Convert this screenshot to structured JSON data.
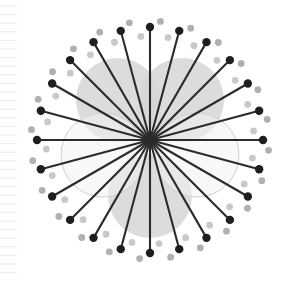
{
  "figure": {
    "width": 299,
    "height": 282,
    "background_color": "#ffffff"
  },
  "chart_data": {
    "type": "scatter",
    "subtitle": "",
    "xlabel": "",
    "ylabel": "",
    "grid": false,
    "legend_position": "none",
    "xlim": [
      0,
      299
    ],
    "ylim": [
      0,
      282
    ],
    "center": {
      "x": 150,
      "y": 140
    },
    "spokes": {
      "count": 24,
      "angle_step_deg": 15,
      "start_angle_deg": 90,
      "inner_radius": 0,
      "outer_radius": 113,
      "line_color": "#2b2b2b",
      "line_width": 2.1,
      "endpoint_marker": {
        "shape": "circle",
        "radius": 4.2,
        "color": "#1f1f1f"
      },
      "angles_deg": [
        0,
        15,
        30,
        45,
        60,
        75,
        90,
        105,
        120,
        135,
        150,
        165,
        180,
        195,
        210,
        225,
        240,
        255,
        270,
        285,
        300,
        315,
        330,
        345
      ],
      "lengths": [
        113,
        113,
        113,
        113,
        113,
        113,
        113,
        113,
        113,
        113,
        113,
        113,
        113,
        113,
        113,
        113,
        113,
        113,
        113,
        113,
        113,
        113,
        113,
        113
      ]
    },
    "light_dots": {
      "count": 48,
      "note": "two interleaved rings of pale markers between the spoke endpoints",
      "rings": [
        {
          "name": "inner-pale-ring",
          "radius": 104,
          "angle_offset_deg": 5,
          "angle_step_deg": 15,
          "color": "#c9c9c9",
          "marker_radius": 3.4
        },
        {
          "name": "outer-pale-ring",
          "radius": 119,
          "angle_offset_deg": 10,
          "angle_step_deg": 15,
          "color": "#b0b0b0",
          "marker_radius": 3.4
        }
      ]
    },
    "circles": [
      {
        "name": "upper-left-blob",
        "cx": 118,
        "cy": 100,
        "r": 42,
        "fill": "#d6d6d6",
        "fill_opacity": 0.85,
        "stroke": "none",
        "stroke_opacity": 0
      },
      {
        "name": "upper-right-blob",
        "cx": 182,
        "cy": 100,
        "r": 42,
        "fill": "#d6d6d6",
        "fill_opacity": 0.85,
        "stroke": "none",
        "stroke_opacity": 0
      },
      {
        "name": "bottom-blob",
        "cx": 150,
        "cy": 196,
        "r": 42,
        "fill": "#d6d6d6",
        "fill_opacity": 0.85,
        "stroke": "none",
        "stroke_opacity": 0
      },
      {
        "name": "left-outline",
        "cx": 103,
        "cy": 155,
        "r": 42,
        "fill": "#f2f2f2",
        "fill_opacity": 0.55,
        "stroke": "#d0d0d0",
        "stroke_opacity": 1
      },
      {
        "name": "right-outline",
        "cx": 197,
        "cy": 155,
        "r": 42,
        "fill": "#f2f2f2",
        "fill_opacity": 0.55,
        "stroke": "#d0d0d0",
        "stroke_opacity": 1
      }
    ],
    "ruler": {
      "name": "left-edge-tick-scale",
      "orientation": "vertical",
      "x_start": 0,
      "x_end": 17,
      "y_first": 6,
      "y_last": 276,
      "tick_spacing": 8.6,
      "tick_count": 32,
      "color": "#f0f0f0",
      "line_width": 1.4
    }
  },
  "colors": {
    "background": "#ffffff",
    "spoke": "#2b2b2b",
    "dark_dot": "#1f1f1f",
    "pale_dot_light": "#c9c9c9",
    "pale_dot_mid": "#b0b0b0",
    "blob_fill": "#d6d6d6",
    "outline_circle_stroke": "#d0d0d0",
    "outline_circle_fill": "#f2f2f2",
    "ruler_tick": "#f0f0f0"
  }
}
